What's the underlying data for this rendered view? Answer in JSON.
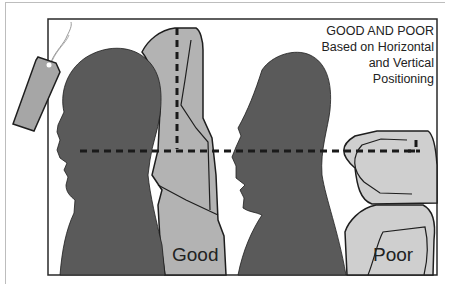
{
  "caption": {
    "lines": [
      "GOOD AND POOR",
      "Based on Horizontal",
      "and Vertical",
      "Positioning"
    ]
  },
  "labels": {
    "good": "Good",
    "poor": "Poor"
  },
  "colors": {
    "head_silhouette": "#5a5a5a",
    "seat_fill": "#b3b3b3",
    "poor_seat_fill": "#cfcfcf",
    "outline": "#1e1e1e",
    "dashed_line": "#1a1a1a",
    "tag_fill": "#a6a6a6"
  }
}
